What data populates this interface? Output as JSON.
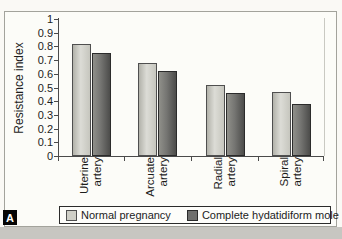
{
  "panel_label": "A",
  "chart_data": {
    "type": "bar",
    "title": "",
    "ylabel": "Resistance index",
    "xlabel": "",
    "ylim": [
      0,
      1
    ],
    "ytick_step": 0.1,
    "yticks": [
      1,
      0.9,
      0.8,
      0.7,
      0.6,
      0.5,
      0.4,
      0.3,
      0.2,
      0.1,
      0
    ],
    "ytick_labels": [
      "1",
      "0.9",
      "0.8",
      "0.7",
      "0.6",
      "0.5",
      "0.4",
      "0.3",
      "0.2",
      "0.1",
      "0"
    ],
    "categories": [
      "Uterine artery",
      "Arcuate artery",
      "Radial artery",
      "Spiral artery"
    ],
    "category_label_lines": [
      [
        "Uterine",
        "artery"
      ],
      [
        "Arcuate",
        "artery"
      ],
      [
        "Radial",
        "artery"
      ],
      [
        "Spiral",
        "artery"
      ]
    ],
    "series": [
      {
        "name": "Normal pregnancy",
        "values": [
          0.82,
          0.68,
          0.52,
          0.47
        ],
        "fill": [
          "#b2b2aa",
          "#dcdcd6",
          "#c6c6be"
        ],
        "border": "#4f4f4f",
        "swatch": "#cfcfc7"
      },
      {
        "name": "Complete hydatidiform mole",
        "values": [
          0.75,
          0.62,
          0.46,
          0.38
        ],
        "fill": [
          "#90908a",
          "#757572",
          "#4c4c4a"
        ],
        "border": "#2b2b2b",
        "swatch": "#6f6f6d"
      }
    ],
    "legend_position": "bottom",
    "grid": false
  },
  "colors": {
    "axis": "#4a4a4a",
    "text": "#1c1c1c",
    "frame_border": "#a3a39c",
    "figure_bg": "#fcfcf8",
    "outside_strip": "#c7c6c1"
  }
}
